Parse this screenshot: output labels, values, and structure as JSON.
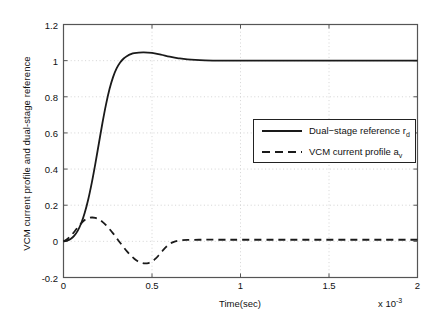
{
  "chart_data": {
    "type": "line",
    "title": "",
    "xlabel": "Time(sec)",
    "ylabel": "VCM current profile and dual-stage reference",
    "x_multiplier": "x 10",
    "x_multiplier_exp": "-3",
    "xlim": [
      0,
      2
    ],
    "ylim": [
      -0.2,
      1.2
    ],
    "xticks": [
      "0",
      "0.5",
      "1",
      "1.5",
      "2"
    ],
    "xtick_values": [
      0,
      0.5,
      1,
      1.5,
      2
    ],
    "yticks": [
      "-0.2",
      "0",
      "0.2",
      "0.4",
      "0.6",
      "0.8",
      "1",
      "1.2"
    ],
    "ytick_values": [
      -0.2,
      0,
      0.2,
      0.4,
      0.6,
      0.8,
      1,
      1.2
    ],
    "grid": true,
    "grid_style": "dotted",
    "legend_position": "center-right",
    "series": [
      {
        "name": "Dual-stage reference r",
        "name_sub": "d",
        "style": "solid",
        "color": "#1a1a1a",
        "width": 1.8,
        "x": [
          0,
          0.02,
          0.04,
          0.06,
          0.08,
          0.1,
          0.12,
          0.14,
          0.16,
          0.18,
          0.2,
          0.22,
          0.24,
          0.26,
          0.28,
          0.3,
          0.32,
          0.34,
          0.36,
          0.38,
          0.4,
          0.45,
          0.5,
          0.55,
          0.6,
          0.65,
          0.7,
          0.8,
          0.9,
          1.0,
          1.2,
          1.4,
          1.6,
          1.8,
          2.0
        ],
        "y": [
          0.0,
          0.004,
          0.013,
          0.03,
          0.058,
          0.1,
          0.158,
          0.233,
          0.325,
          0.43,
          0.543,
          0.655,
          0.757,
          0.843,
          0.909,
          0.957,
          0.99,
          1.012,
          1.026,
          1.036,
          1.042,
          1.046,
          1.043,
          1.033,
          1.022,
          1.013,
          1.007,
          1.002,
          1.0,
          1.0,
          1.0,
          1.0,
          1.0,
          1.0,
          1.0
        ]
      },
      {
        "name": "VCM current profile a",
        "name_sub": "v",
        "style": "dashed",
        "color": "#1a1a1a",
        "width": 1.8,
        "x": [
          0,
          0.02,
          0.04,
          0.06,
          0.08,
          0.1,
          0.12,
          0.14,
          0.16,
          0.18,
          0.2,
          0.22,
          0.24,
          0.26,
          0.28,
          0.3,
          0.32,
          0.34,
          0.36,
          0.38,
          0.4,
          0.42,
          0.44,
          0.46,
          0.48,
          0.5,
          0.52,
          0.54,
          0.56,
          0.58,
          0.6,
          0.62,
          0.65,
          0.7,
          0.8,
          0.9,
          1.0,
          1.2,
          1.4,
          1.6,
          1.8,
          2.0
        ],
        "y": [
          0.0,
          0.012,
          0.03,
          0.052,
          0.077,
          0.1,
          0.118,
          0.128,
          0.132,
          0.13,
          0.122,
          0.108,
          0.09,
          0.068,
          0.044,
          0.018,
          -0.008,
          -0.033,
          -0.057,
          -0.078,
          -0.096,
          -0.11,
          -0.118,
          -0.122,
          -0.12,
          -0.112,
          -0.096,
          -0.075,
          -0.052,
          -0.031,
          -0.015,
          -0.004,
          0.004,
          0.008,
          0.009,
          0.009,
          0.009,
          0.009,
          0.009,
          0.009,
          0.009,
          0.009
        ]
      }
    ]
  },
  "legend": {
    "entries": [
      {
        "label_main": "Dual−stage reference r",
        "label_sub": "d",
        "style": "solid"
      },
      {
        "label_main": "VCM current profile a",
        "label_sub": "v",
        "style": "dashed"
      }
    ]
  },
  "colors": {
    "axis": "#555555",
    "grid": "#c9c9c9",
    "line": "#1a1a1a",
    "background": "#ffffff"
  }
}
